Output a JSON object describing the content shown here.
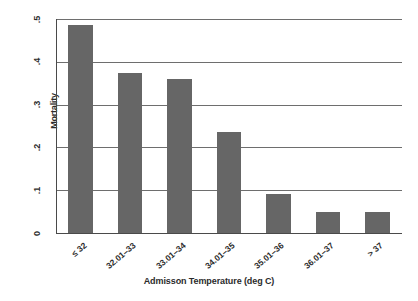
{
  "chart_data": {
    "type": "bar",
    "title": "",
    "xlabel": "Admisson Temperature (deg C)",
    "ylabel": "Mortality",
    "categories": [
      "≤ 32",
      "32.01–33",
      "33.01–34",
      "34.01–35",
      "35.01–36",
      "36.01–37",
      "> 37"
    ],
    "values": [
      0.485,
      0.375,
      0.36,
      0.235,
      0.09,
      0.048,
      0.048
    ],
    "ylim": [
      0,
      0.5
    ],
    "yticks": [
      0,
      0.1,
      0.2,
      0.3,
      0.4,
      0.5
    ],
    "ytick_labels": [
      "0",
      ".1",
      ".2",
      ".3",
      ".4",
      ".5"
    ],
    "grid": "horizontal",
    "legend": "none",
    "bar_color": "#666666",
    "axis_color": "#4a4a4a",
    "gridline_color": "#6e6e6e",
    "background": "#ffffff"
  }
}
